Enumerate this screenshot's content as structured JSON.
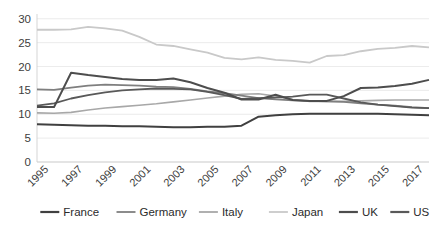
{
  "chart_data": {
    "type": "line",
    "title": "",
    "subtitle": "",
    "xlabel": "",
    "ylabel": "",
    "x": [
      1995,
      1996,
      1997,
      1998,
      1999,
      2000,
      2001,
      2002,
      2003,
      2004,
      2005,
      2006,
      2007,
      2008,
      2009,
      2010,
      2011,
      2012,
      2013,
      2014,
      2015,
      2016,
      2017,
      2018
    ],
    "xtick_labels": [
      "1995",
      "1997",
      "1999",
      "2001",
      "2003",
      "2005",
      "2007",
      "2009",
      "2011",
      "2013",
      "2015",
      "2017"
    ],
    "xtick_values": [
      1995,
      1997,
      1999,
      2001,
      2003,
      2005,
      2007,
      2009,
      2011,
      2013,
      2015,
      2017
    ],
    "ytick_labels": [
      "0",
      "5",
      "10",
      "15",
      "20",
      "25",
      "30"
    ],
    "ytick_values": [
      0,
      5,
      10,
      15,
      20,
      25,
      30
    ],
    "ylim": [
      0,
      31
    ],
    "xlim": [
      1995,
      2018
    ],
    "grid": true,
    "grid_axis": "y",
    "legend_position": "bottom",
    "series": [
      {
        "name": "France",
        "color": "#404040",
        "width": 2.0,
        "values": [
          7.9,
          7.8,
          7.7,
          7.6,
          7.6,
          7.5,
          7.5,
          7.4,
          7.3,
          7.3,
          7.4,
          7.4,
          7.6,
          9.5,
          9.8,
          10.0,
          10.1,
          10.1,
          10.1,
          10.1,
          10.1,
          10.0,
          9.9,
          9.8
        ]
      },
      {
        "name": "Germany",
        "color": "#7f7f7f",
        "width": 1.8,
        "values": [
          15.2,
          15.1,
          15.6,
          16.0,
          16.2,
          16.1,
          16.0,
          15.8,
          15.7,
          15.3,
          14.8,
          14.4,
          13.9,
          13.4,
          13.1,
          12.9,
          12.8,
          12.7,
          12.6,
          12.3,
          12.0,
          11.8,
          11.5,
          11.3
        ]
      },
      {
        "name": "Italy",
        "color": "#a8a8a8",
        "width": 1.6,
        "values": [
          10.3,
          10.2,
          10.4,
          10.9,
          11.3,
          11.6,
          11.9,
          12.2,
          12.6,
          13.0,
          13.4,
          13.8,
          14.2,
          14.3,
          13.8,
          13.1,
          12.7,
          12.7,
          12.7,
          12.8,
          12.9,
          13.0,
          13.0,
          13.0
        ]
      },
      {
        "name": "Japan",
        "color": "#c9c9c9",
        "width": 1.8,
        "values": [
          27.7,
          27.7,
          27.8,
          28.3,
          28.0,
          27.5,
          26.2,
          24.6,
          24.3,
          23.6,
          22.9,
          21.8,
          21.5,
          21.9,
          21.4,
          21.2,
          20.8,
          22.2,
          22.4,
          23.2,
          23.7,
          23.9,
          24.3,
          24.0
        ]
      },
      {
        "name": "UK",
        "color": "#4d4d4d",
        "width": 2.0,
        "values": [
          11.5,
          11.5,
          18.7,
          18.2,
          17.8,
          17.4,
          17.2,
          17.2,
          17.5,
          16.7,
          15.5,
          14.5,
          13.1,
          13.1,
          14.1,
          13.0,
          12.8,
          12.8,
          13.8,
          15.5,
          15.6,
          15.9,
          16.4,
          17.2
        ]
      },
      {
        "name": "US",
        "color": "#595959",
        "width": 1.8,
        "values": [
          11.8,
          12.3,
          13.3,
          14.0,
          14.6,
          15.0,
          15.2,
          15.4,
          15.3,
          15.2,
          14.7,
          14.0,
          13.2,
          13.4,
          13.5,
          13.7,
          14.1,
          14.1,
          13.3,
          12.5,
          12.0,
          11.7,
          11.4,
          11.3
        ]
      }
    ]
  },
  "legend": {
    "items": [
      {
        "label": "France",
        "color": "#404040"
      },
      {
        "label": "Germany",
        "color": "#7f7f7f"
      },
      {
        "label": "Italy",
        "color": "#a8a8a8"
      },
      {
        "label": "Japan",
        "color": "#c9c9c9"
      },
      {
        "label": "UK",
        "color": "#4d4d4d"
      },
      {
        "label": "US",
        "color": "#595959"
      }
    ]
  },
  "axes": {
    "y_ticks": [
      "0",
      "5",
      "10",
      "15",
      "20",
      "25",
      "30"
    ],
    "x_ticks": [
      "1995",
      "1997",
      "1999",
      "2001",
      "2003",
      "2005",
      "2007",
      "2009",
      "2011",
      "2013",
      "2015",
      "2017"
    ],
    "gridline_color": "#e6e6e6",
    "axis_color": "#d0d0d0",
    "tick_text_color": "#3d3d3d"
  }
}
